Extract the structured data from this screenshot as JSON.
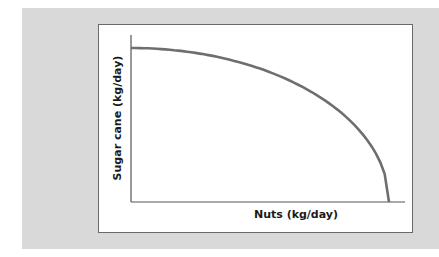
{
  "chart_data": {
    "type": "line",
    "title": "",
    "xlabel": "Nuts (kg/day)",
    "ylabel": "Sugar cane (kg/day)",
    "grid": false,
    "legend": null,
    "series": [
      {
        "name": "Production possibilities frontier",
        "color": "#6e6e6e",
        "x": [
          0,
          0.1,
          0.2,
          0.3,
          0.4,
          0.5,
          0.6,
          0.7,
          0.8,
          0.9,
          0.95,
          1.0
        ],
        "y": [
          1.0,
          0.995,
          0.98,
          0.954,
          0.917,
          0.866,
          0.8,
          0.714,
          0.6,
          0.436,
          0.312,
          0
        ]
      }
    ],
    "xlim": [
      0,
      1.06
    ],
    "ylim": [
      0,
      1.08
    ]
  },
  "colors": {
    "background": "#d9d9d9",
    "panel": "#ffffff",
    "axis": "#555555",
    "curve": "#6e6e6e"
  }
}
